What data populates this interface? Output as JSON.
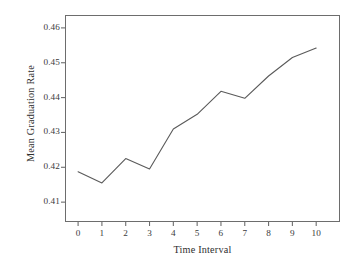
{
  "chart_data": {
    "type": "line",
    "title": "",
    "xlabel": "Time Interval",
    "ylabel": "Mean Graduation Rate",
    "x": [
      0,
      1,
      2,
      3,
      4,
      5,
      6,
      7,
      8,
      9,
      10
    ],
    "values": [
      0.4187,
      0.4155,
      0.4225,
      0.4195,
      0.431,
      0.4352,
      0.4418,
      0.4398,
      0.4462,
      0.4515,
      0.4542
    ],
    "series": [
      {
        "name": "Mean Graduation Rate",
        "values": [
          0.4187,
          0.4155,
          0.4225,
          0.4195,
          0.431,
          0.4352,
          0.4418,
          0.4398,
          0.4462,
          0.4515,
          0.4542
        ]
      }
    ],
    "xlim": [
      -0.55,
      11.0
    ],
    "ylim": [
      0.4043,
      0.4637
    ],
    "xticks": [
      0,
      1,
      2,
      3,
      4,
      5,
      6,
      7,
      8,
      9,
      10
    ],
    "xtick_labels": [
      "0",
      "1",
      "2",
      "3",
      "4",
      "5",
      "6",
      "7",
      "8",
      "9",
      "10"
    ],
    "yticks": [
      0.41,
      0.42,
      0.43,
      0.44,
      0.45,
      0.46
    ],
    "ytick_labels": [
      "0.41",
      "0.42",
      "0.43",
      "0.44",
      "0.45",
      "0.46"
    ],
    "grid": false,
    "legend": "none",
    "line_color": "#5a5a5a",
    "frame_color": "#6d6d6d",
    "background": "#ffffff"
  },
  "axes": {
    "x_title": "Time Interval",
    "y_title": "Mean Graduation Rate"
  }
}
